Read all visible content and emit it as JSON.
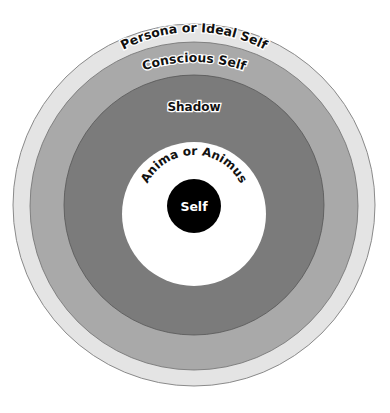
{
  "diagram": {
    "layers": [
      {
        "name": "Persona or Ideal Self",
        "color": "#e4e4e4",
        "radius": 181
      },
      {
        "name": "Conscious Self",
        "color": "#a9a9a9",
        "radius": 163
      },
      {
        "name": "Shadow",
        "color": "#7b7b7b",
        "radius": 129
      },
      {
        "name": "Anima or Animus",
        "color": "#ffffff",
        "radius": 72
      },
      {
        "name": "Self",
        "color": "#000000",
        "radius": 27
      }
    ],
    "labels": {
      "persona": "Persona or Ideal Self",
      "conscious": "Conscious Self",
      "shadow": "Shadow",
      "anima": "Anima or Animus",
      "self": "Self"
    }
  }
}
